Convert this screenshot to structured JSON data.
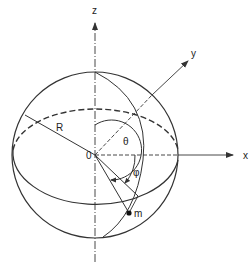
{
  "diagram": {
    "type": "spherical-coordinates",
    "labels": {
      "z_axis": "z",
      "y_axis": "y",
      "x_axis": "x",
      "origin": "0",
      "radius": "R",
      "theta": "θ",
      "phi": "φ",
      "point": "m"
    },
    "colors": {
      "stroke": "#333333",
      "background": "#ffffff"
    }
  }
}
